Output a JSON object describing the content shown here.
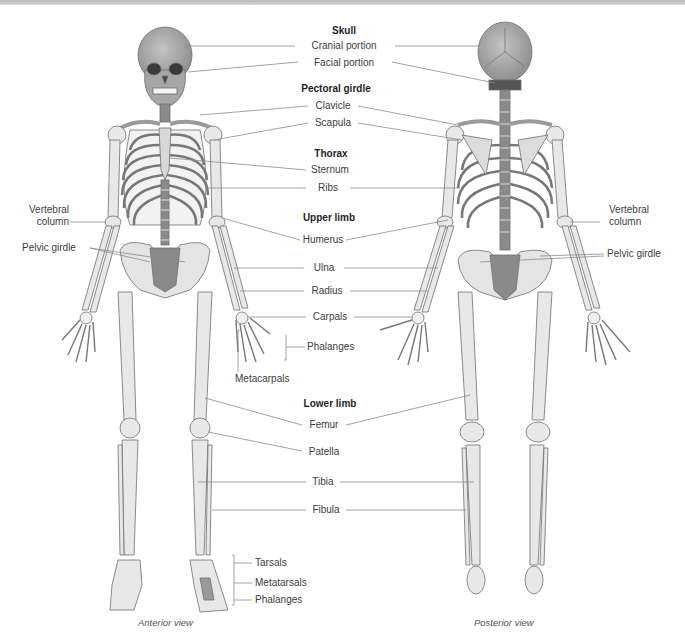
{
  "figure": {
    "colors": {
      "bone_fill": "#e6e6e6",
      "bone_stroke": "#6e6e6e",
      "dark_bone": "#8a8a8a",
      "skull_fill": "#9e9e9e",
      "leader_line": "#8c8c8c",
      "top_bar": "#c4c4c4"
    },
    "sections": {
      "skull": {
        "heading": "Skull",
        "items": [
          "Cranial portion",
          "Facial portion"
        ]
      },
      "pectoral_girdle": {
        "heading": "Pectoral girdle",
        "items": [
          "Clavicle",
          "Scapula"
        ]
      },
      "thorax": {
        "heading": "Thorax",
        "items": [
          "Sternum",
          "Ribs"
        ]
      },
      "upper_limb": {
        "heading": "Upper limb",
        "items": [
          "Humerus",
          "Ulna",
          "Radius",
          "Carpals",
          "Phalanges",
          "Metacarpals"
        ]
      },
      "lower_limb": {
        "heading": "Lower limb",
        "items": [
          "Femur",
          "Patella",
          "Tibia",
          "Fibula",
          "Tarsals",
          "Metatarsals",
          "Phalanges"
        ]
      }
    },
    "left_labels": {
      "vertebral_column": [
        "Vertebral",
        "column"
      ],
      "pelvic_girdle": "Pelvic girdle"
    },
    "right_labels": {
      "vertebral_column": [
        "Vertebral",
        "column"
      ],
      "pelvic_girdle": "Pelvic girdle"
    },
    "captions": {
      "anterior": "Anterior view",
      "posterior": "Posterior view"
    }
  }
}
